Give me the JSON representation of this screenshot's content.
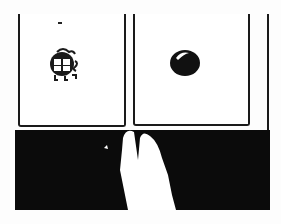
{
  "image": {
    "description": "Black-and-white illustration: two framed panels, left with a small cartoon bug-like figure, right with a dark glossy ball; below, a black band with a white hand reaching upward.",
    "panels": [
      {
        "position": "left",
        "content": "cartoon-figure"
      },
      {
        "position": "right",
        "content": "dark-ball"
      }
    ],
    "colors": {
      "background": "#ffffff",
      "ink": "#1a1a1a",
      "band": "#0b0b0b",
      "hand": "#ffffff"
    }
  }
}
